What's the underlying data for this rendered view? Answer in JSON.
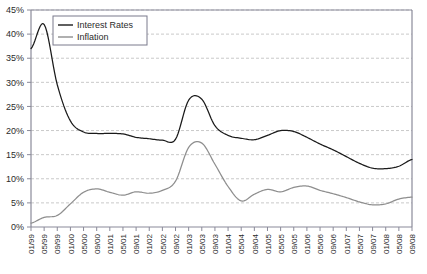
{
  "chart_data": {
    "type": "line",
    "title": "",
    "xlabel": "",
    "ylabel": "",
    "ylim": [
      0,
      45
    ],
    "ytick_step": 5,
    "grid": true,
    "legend_position": "top-left",
    "ytick_labels": [
      "0%",
      "5%",
      "10%",
      "15%",
      "20%",
      "25%",
      "30%",
      "35%",
      "40%",
      "45%"
    ],
    "ytick_values": [
      0,
      5,
      10,
      15,
      20,
      25,
      30,
      35,
      40,
      45
    ],
    "categories": [
      "01/99",
      "05/99",
      "09/99",
      "01/00",
      "05/00",
      "09/00",
      "01/01",
      "05/01",
      "09/01",
      "01/02",
      "05/02",
      "09/02",
      "01/03",
      "05/03",
      "09/03",
      "01/04",
      "05/04",
      "09/04",
      "01/05",
      "05/05",
      "09/05",
      "01/06",
      "05/06",
      "09/06",
      "01/07",
      "05/07",
      "09/07",
      "01/08",
      "05/08",
      "09/08"
    ],
    "x_tick_interval_months": 4,
    "series": [
      {
        "name": "Interest Rates",
        "color": "#1a1a1a",
        "values": [
          37.0,
          42.0,
          29.5,
          22.0,
          19.7,
          19.4,
          19.4,
          19.3,
          18.6,
          18.3,
          18.0,
          18.2,
          26.3,
          26.5,
          21.0,
          19.0,
          18.4,
          18.1,
          19.0,
          20.0,
          19.8,
          18.6,
          17.2,
          16.0,
          14.6,
          13.2,
          12.2,
          12.1,
          12.6,
          14.0
        ]
      },
      {
        "name": "Inflation",
        "color": "#8e8e8e",
        "values": [
          0.8,
          2.0,
          2.4,
          4.8,
          7.2,
          7.9,
          7.2,
          6.6,
          7.3,
          7.0,
          7.6,
          9.5,
          16.5,
          17.4,
          13.0,
          8.4,
          5.4,
          6.8,
          7.8,
          7.3,
          8.2,
          8.5,
          7.6,
          6.9,
          6.1,
          5.2,
          4.6,
          4.8,
          5.8,
          6.2
        ]
      }
    ]
  },
  "legend": {
    "items": [
      {
        "label": "Interest Rates"
      },
      {
        "label": "Inflation"
      }
    ]
  }
}
